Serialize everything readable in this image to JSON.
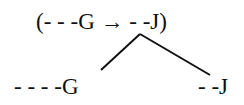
{
  "diagram": {
    "top_expression": "(- - -G → - -J)",
    "left_branch": "- - - -G",
    "right_branch": "- -J",
    "line_color": "#111111"
  }
}
